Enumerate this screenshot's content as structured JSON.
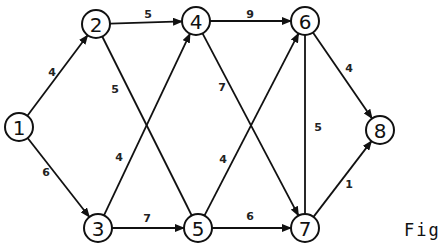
{
  "figure": {
    "caption": "Fig"
  },
  "nodes": [
    {
      "id": "1",
      "label": "1",
      "x": 19,
      "y": 127
    },
    {
      "id": "2",
      "label": "2",
      "x": 96,
      "y": 24
    },
    {
      "id": "3",
      "label": "3",
      "x": 98,
      "y": 228
    },
    {
      "id": "4",
      "label": "4",
      "x": 196,
      "y": 21
    },
    {
      "id": "5",
      "label": "5",
      "x": 198,
      "y": 228
    },
    {
      "id": "6",
      "label": "6",
      "x": 305,
      "y": 21
    },
    {
      "id": "7",
      "label": "7",
      "x": 305,
      "y": 228
    },
    {
      "id": "8",
      "label": "8",
      "x": 380,
      "y": 130
    }
  ],
  "edges": [
    {
      "from": "1",
      "to": "2",
      "weight": "4",
      "arrow": true,
      "lx": 52,
      "ly": 72
    },
    {
      "from": "1",
      "to": "3",
      "weight": "6",
      "arrow": true,
      "lx": 46,
      "ly": 172
    },
    {
      "from": "2",
      "to": "4",
      "weight": "5",
      "arrow": true,
      "lx": 148,
      "ly": 14
    },
    {
      "from": "2",
      "to": "5",
      "weight": "5",
      "arrow": false,
      "lx": 115,
      "ly": 89
    },
    {
      "from": "3",
      "to": "4",
      "weight": "4",
      "arrow": true,
      "lx": 119,
      "ly": 157
    },
    {
      "from": "3",
      "to": "5",
      "weight": "7",
      "arrow": true,
      "lx": 147,
      "ly": 218
    },
    {
      "from": "4",
      "to": "6",
      "weight": "9",
      "arrow": true,
      "lx": 250,
      "ly": 14
    },
    {
      "from": "4",
      "to": "7",
      "weight": "7",
      "arrow": true,
      "lx": 222,
      "ly": 87
    },
    {
      "from": "5",
      "to": "6",
      "weight": "4",
      "arrow": true,
      "lx": 223,
      "ly": 159
    },
    {
      "from": "5",
      "to": "7",
      "weight": "6",
      "arrow": true,
      "lx": 250,
      "ly": 216
    },
    {
      "from": "6",
      "to": "7",
      "weight": "5",
      "arrow": false,
      "lx": 318,
      "ly": 127
    },
    {
      "from": "6",
      "to": "8",
      "weight": "4",
      "arrow": true,
      "lx": 349,
      "ly": 68
    },
    {
      "from": "7",
      "to": "8",
      "weight": "1",
      "arrow": true,
      "lx": 349,
      "ly": 184
    }
  ],
  "style": {
    "stroke": "#111111",
    "background": "#ffffff"
  }
}
